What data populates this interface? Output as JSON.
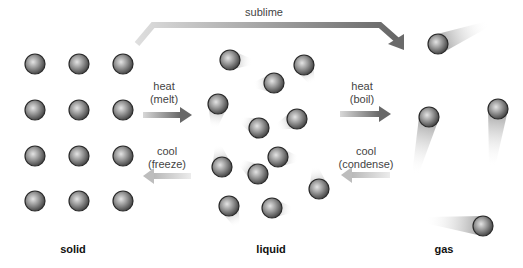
{
  "colors": {
    "arrow_dark": "#6e6e6e",
    "arrow_light": "#c8c8c8",
    "particle_dark": "#3a3a3a",
    "particle_light": "#d8d8d8",
    "text": "#444444"
  },
  "phases": [
    {
      "id": "solid",
      "label": "solid",
      "x": 79
    },
    {
      "id": "liquid",
      "label": "liquid",
      "x": 271
    },
    {
      "id": "gas",
      "label": "gas",
      "x": 450
    }
  ],
  "transitions": {
    "sublime": {
      "label": "sublime"
    },
    "melt": {
      "line1": "heat",
      "line2": "(melt)"
    },
    "freeze": {
      "line1": "cool",
      "line2": "(freeze)"
    },
    "boil": {
      "line1": "heat",
      "line2": "(boil)"
    },
    "condense": {
      "line1": "cool",
      "line2": "(condense)"
    }
  },
  "particles": {
    "solid": [
      [
        35,
        64
      ],
      [
        79,
        64
      ],
      [
        123,
        64
      ],
      [
        35,
        110
      ],
      [
        79,
        110
      ],
      [
        123,
        110
      ],
      [
        35,
        156
      ],
      [
        79,
        156
      ],
      [
        123,
        156
      ],
      [
        35,
        201
      ],
      [
        79,
        201
      ],
      [
        123,
        201
      ]
    ],
    "liquid": [
      {
        "x": 230,
        "y": 60,
        "tx": 22,
        "ty": 2
      },
      {
        "x": 304,
        "y": 65,
        "tx": 8,
        "ty": 18
      },
      {
        "x": 274,
        "y": 83,
        "tx": -20,
        "ty": 2
      },
      {
        "x": 218,
        "y": 104,
        "tx": -4,
        "ty": 24
      },
      {
        "x": 297,
        "y": 119,
        "tx": -20,
        "ty": 8
      },
      {
        "x": 259,
        "y": 128,
        "tx": -18,
        "ty": -8
      },
      {
        "x": 278,
        "y": 157,
        "tx": 20,
        "ty": 2
      },
      {
        "x": 222,
        "y": 167,
        "tx": -4,
        "ty": -22
      },
      {
        "x": 258,
        "y": 174,
        "tx": -18,
        "ty": -12
      },
      {
        "x": 319,
        "y": 189,
        "tx": -4,
        "ty": -22
      },
      {
        "x": 229,
        "y": 206,
        "tx": 8,
        "ty": 20
      },
      {
        "x": 272,
        "y": 208,
        "tx": 20,
        "ty": 2
      }
    ],
    "gas": [
      {
        "x": 438,
        "y": 44,
        "tx": 50,
        "ty": -20
      },
      {
        "x": 429,
        "y": 117,
        "tx": -14,
        "ty": 58
      },
      {
        "x": 498,
        "y": 109,
        "tx": -6,
        "ty": 58
      },
      {
        "x": 483,
        "y": 226,
        "tx": -58,
        "ty": -6
      }
    ]
  }
}
